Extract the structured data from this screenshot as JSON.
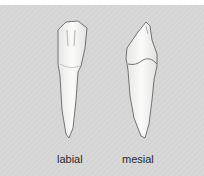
{
  "figure": {
    "type": "tooth-views-illustration",
    "views": [
      {
        "id": "labial",
        "label": "labial"
      },
      {
        "id": "mesial",
        "label": "mesial"
      }
    ],
    "colors": {
      "background": "#d5d5d5",
      "tooth_fill": "#f4f4f2",
      "tooth_outline": "#555555",
      "label_text": "#2a2a2a"
    }
  }
}
